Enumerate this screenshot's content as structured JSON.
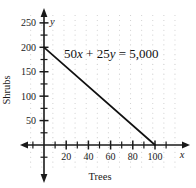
{
  "chart_data": {
    "type": "line",
    "title": "",
    "equation_label": "50x + 25y = 5,000",
    "equation_parts": {
      "coef_x": "50",
      "var_x": "x",
      "plus": " + ",
      "coef_y": "25",
      "var_y": "y",
      "equals": " = ",
      "rhs": "5,000"
    },
    "xlabel": "Trees",
    "ylabel": "Shrubs",
    "x_axis_var": "x",
    "y_axis_var": "y",
    "xlim": [
      -12,
      125
    ],
    "ylim": [
      -45,
      272
    ],
    "x_ticks_labeled": [
      20,
      40,
      60,
      80,
      100
    ],
    "x_tick_labels": [
      "20",
      "40",
      "60",
      "80",
      "100"
    ],
    "y_ticks_labeled": [
      50,
      100,
      150,
      200,
      250
    ],
    "y_tick_labels": [
      "50",
      "100",
      "150",
      "200",
      "250"
    ],
    "x_ticks_minor": [
      -10,
      10,
      30,
      50,
      70,
      90,
      110
    ],
    "y_ticks_minor": [
      -25,
      25,
      75,
      125,
      175,
      225
    ],
    "grid": "dots",
    "grid_spacing": 10,
    "legend": "none",
    "series": [
      {
        "name": "50x + 25y = 5,000",
        "x": [
          0,
          100
        ],
        "y": [
          200,
          0
        ],
        "x_intercept": 100,
        "y_intercept": 200,
        "slope": -2
      }
    ],
    "colors": {
      "line": "#111111",
      "axis": "#1a1a1a",
      "grid_dot": "#c9c9c9",
      "text": "#1a1a1a",
      "background": "#ffffff"
    }
  }
}
